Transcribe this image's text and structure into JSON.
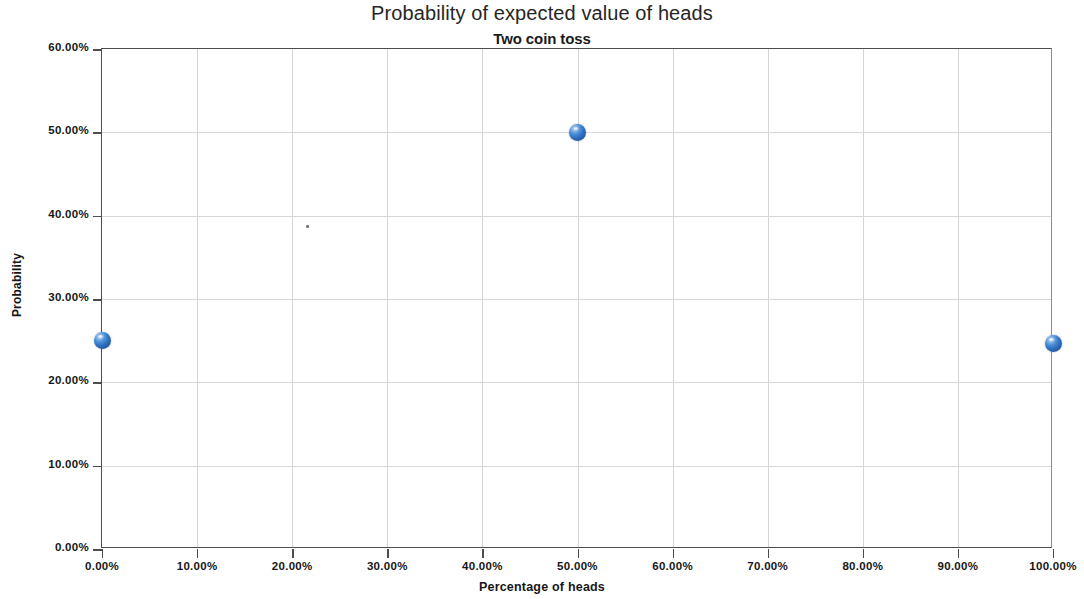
{
  "chart_data": {
    "type": "scatter",
    "title": "Probability of expected value of heads",
    "subtitle": "Two coin toss",
    "xlabel": "Percentage of heads",
    "ylabel": "Probability",
    "xlim": [
      0,
      100
    ],
    "ylim": [
      0,
      60
    ],
    "grid": true,
    "legend": "none",
    "x_tick_labels": [
      "0.00%",
      "10.00%",
      "20.00%",
      "30.00%",
      "40.00%",
      "50.00%",
      "60.00%",
      "70.00%",
      "80.00%",
      "90.00%",
      "100.00%"
    ],
    "x_tick_values": [
      0,
      10,
      20,
      30,
      40,
      50,
      60,
      70,
      80,
      90,
      100
    ],
    "y_tick_labels": [
      "0.00%",
      "10.00%",
      "20.00%",
      "30.00%",
      "40.00%",
      "50.00%",
      "60.00%"
    ],
    "y_tick_values": [
      0,
      10,
      20,
      30,
      40,
      50,
      60
    ],
    "series": [
      {
        "name": "Probability of expected value of heads",
        "marker": "sphere",
        "color": "#2f6fbf",
        "points": [
          {
            "x": 0,
            "y": 25.0,
            "label": "0.00%, 25.00%"
          },
          {
            "x": 50,
            "y": 50.0,
            "label": "50.00%, 50.00%"
          },
          {
            "x": 100,
            "y": 24.7,
            "label": "100.00%, 24.70%"
          }
        ]
      }
    ],
    "colors": {
      "marker_fill": "#2f6fbf",
      "marker_highlight": "#cfe2f6",
      "gridline": "#d4d4d8",
      "axis_line": "#4d4d4d",
      "text": "#171717",
      "plot_background": "#ffffff"
    }
  }
}
